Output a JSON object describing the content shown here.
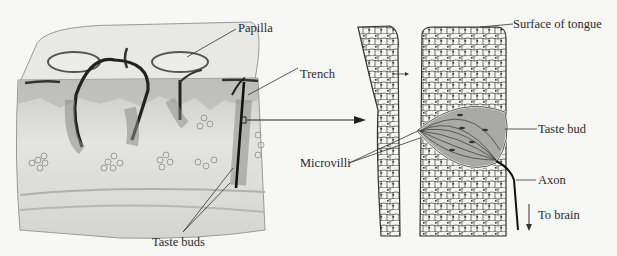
{
  "figure": {
    "left_panel": {
      "description": "Block section of tongue surface with papillae",
      "labels": {
        "papilla": "Papilla",
        "trench": "Trench",
        "taste_buds": "Taste buds"
      }
    },
    "right_panel": {
      "description": "Magnified taste bud in trench wall",
      "labels": {
        "surface": "Surface of tongue",
        "taste_bud": "Taste bud",
        "microvilli": "Microvilli",
        "axon": "Axon",
        "to_brain": "To brain"
      }
    },
    "colors": {
      "background": "#f7f7f5",
      "ink": "#2a2a2a",
      "tissue_light": "#e6e6e3",
      "tissue_mid": "#bdbdba",
      "tissue_dark": "#8a8a87",
      "bud_fill": "#a9a9a6"
    }
  }
}
